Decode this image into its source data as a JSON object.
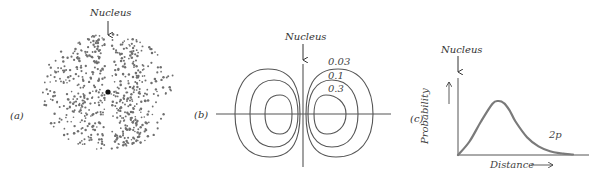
{
  "figure": {
    "panels": [
      {
        "id": "a",
        "label": "(a)",
        "nucleus_label": "Nucleus",
        "description": "Dot-density cloud of a 2p orbital: two lobes with a nodal gap through the nucleus",
        "dot_color": "#6f6f6f",
        "nucleus_color": "#111111"
      },
      {
        "id": "b",
        "label": "(b)",
        "nucleus_label": "Nucleus",
        "description": "Contour plot of 2p electron probability density with nested closed contours on each side of the nodal plane",
        "contour_levels": [
          "0.03",
          "0.1",
          "0.3"
        ],
        "line_color": "#555555"
      },
      {
        "id": "c",
        "label": "(c)",
        "nucleus_label": "Nucleus",
        "ylabel": "Probability",
        "xlabel": "Distance",
        "curve_label": "2p",
        "curve_color": "#7a7a7a"
      }
    ]
  },
  "chart_data": {
    "type": "line",
    "title": "",
    "xlabel": "Distance",
    "ylabel": "Probability",
    "series": [
      {
        "name": "2p",
        "x": [
          0,
          0.1,
          0.2,
          0.3,
          0.35,
          0.4,
          0.45,
          0.5,
          0.6,
          0.7,
          0.8,
          0.9,
          1.0
        ],
        "values": [
          0,
          0.25,
          0.62,
          0.95,
          1.0,
          0.96,
          0.82,
          0.62,
          0.33,
          0.16,
          0.07,
          0.03,
          0.01
        ]
      }
    ],
    "ylim": [
      0,
      1.2
    ],
    "xlim": [
      0,
      1.1
    ],
    "grid": false,
    "legend": "inline label '2p'",
    "annotations": [
      "Nucleus (arrow pointing to origin)"
    ]
  }
}
